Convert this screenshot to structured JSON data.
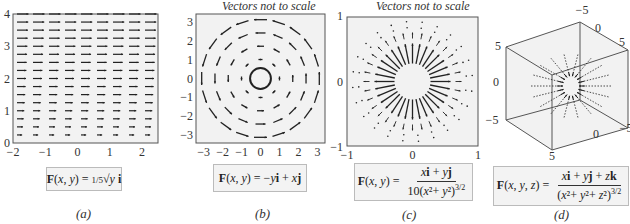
{
  "panels": [
    {
      "id": "a",
      "caption": "(a)",
      "note": "",
      "formula_lhs": "F(x, y) =",
      "formula_text": "F(x, y) = 1/5 √y i",
      "formula_rhs": "⅕ √y i",
      "x_ticks": [
        "−2",
        "−1",
        "0",
        "1",
        "2"
      ],
      "y_ticks": [
        "0",
        "1",
        "2",
        "3",
        "4"
      ]
    },
    {
      "id": "b",
      "caption": "(b)",
      "note": "Vectors not to scale",
      "formula_lhs": "F(x, y) =",
      "formula_rhs": "−y i + x j",
      "formula_text": "F(x, y) = −y i + x j",
      "x_ticks": [
        "−3",
        "−2",
        "−1",
        "0",
        "1",
        "2",
        "3"
      ],
      "y_ticks": [
        "−3",
        "−2",
        "−1",
        "0",
        "1",
        "2",
        "3"
      ]
    },
    {
      "id": "c",
      "caption": "(c)",
      "note": "Vectors not to scale",
      "formula_lhs": "F(x, y) =",
      "formula_num": "x i + y j",
      "formula_den": "10(x² + y²)³ᐟ²",
      "formula_text": "F(x, y) = (x i + y j) / (10(x² + y²)^(3/2))",
      "x_ticks": [
        "−1",
        "0",
        "1"
      ],
      "y_ticks": [
        "−1",
        "0",
        "1"
      ]
    },
    {
      "id": "d",
      "caption": "(d)",
      "note": "",
      "formula_lhs": "F(x, y, z) =",
      "formula_num": "x i + y j + z k",
      "formula_den": "(x² + y² + z²)³ᐟ²",
      "formula_text": "F(x, y, z) = (x i + y j + z k) / (x² + y² + z²)^(3/2)",
      "axis_labels": [
        "−5",
        "0",
        "5",
        "5",
        "0",
        "−5",
        "−5",
        "0",
        "5"
      ]
    }
  ],
  "colors": {
    "arrow": "#222222",
    "frame": "#555555",
    "plot_bg": "#f2f2f2",
    "formula_bg": "#f3f3f3",
    "formula_border": "#bbbbbb"
  }
}
